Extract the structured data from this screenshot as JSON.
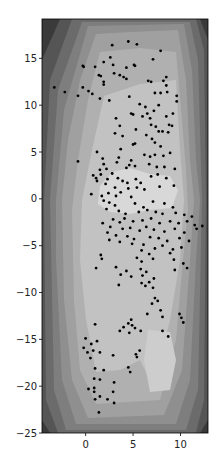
{
  "chart_data": {
    "type": "scatter",
    "subtype": "filled-contour-with-scatter",
    "title": "",
    "xlabel": "",
    "ylabel": "",
    "xlim": [
      -4.6,
      12.9
    ],
    "ylim": [
      -25,
      19.2
    ],
    "xticks": [
      0,
      5,
      10
    ],
    "yticks": [
      15,
      10,
      5,
      0,
      -5,
      -10,
      -15,
      -20,
      -25
    ],
    "grid": false,
    "legend": null,
    "colormap": "grayscale (dark outside, light center)",
    "contour_levels": [
      "#3a3a3a",
      "#555555",
      "#6b6b6b",
      "#7e7e7e",
      "#8f8f8f",
      "#a0a0a0",
      "#b0b0b0",
      "#c2c2c2",
      "#d8d8d8"
    ],
    "point_color": "#000000",
    "points": [
      [
        2.8,
        16.4
      ],
      [
        4.5,
        16.8
      ],
      [
        5.4,
        16.5
      ],
      [
        7.9,
        15.8
      ],
      [
        7.1,
        14.9
      ],
      [
        -0.3,
        14.2
      ],
      [
        -0.2,
        14.1
      ],
      [
        1,
        14.1
      ],
      [
        1.9,
        14.6
      ],
      [
        2.6,
        15.1
      ],
      [
        2.9,
        14.3
      ],
      [
        3,
        13.4
      ],
      [
        3.6,
        13.2
      ],
      [
        4.3,
        14
      ],
      [
        5.1,
        14.3
      ],
      [
        5.2,
        14.2
      ],
      [
        1.4,
        13.2
      ],
      [
        1.6,
        13.1
      ],
      [
        1.9,
        12.5
      ],
      [
        1.9,
        12.2
      ],
      [
        4,
        13
      ],
      [
        4.3,
        12.8
      ],
      [
        6.6,
        12.6
      ],
      [
        6.9,
        12.5
      ],
      [
        8.2,
        12.6
      ],
      [
        8.5,
        13
      ],
      [
        8.5,
        12.1
      ],
      [
        -3.3,
        11.9
      ],
      [
        -2.2,
        11.4
      ],
      [
        -0.8,
        11
      ],
      [
        -0.3,
        11.9
      ],
      [
        0.3,
        11.5
      ],
      [
        0.7,
        11.2
      ],
      [
        1.5,
        10.7
      ],
      [
        2.5,
        10.5
      ],
      [
        4.6,
        10.9
      ],
      [
        7.3,
        11.3
      ],
      [
        7.9,
        11.3
      ],
      [
        8.6,
        11.4
      ],
      [
        9.6,
        11
      ],
      [
        9.6,
        10.4
      ],
      [
        5.7,
        10.1
      ],
      [
        6.3,
        9.8
      ],
      [
        7.7,
        10
      ],
      [
        4.8,
        9.1
      ],
      [
        5,
        9
      ],
      [
        6,
        8.8
      ],
      [
        6.5,
        9.1
      ],
      [
        6.8,
        8.6
      ],
      [
        7.2,
        9.4
      ],
      [
        8.5,
        8.8
      ],
      [
        9.2,
        9.1
      ],
      [
        3.2,
        8.6
      ],
      [
        3.6,
        7.8
      ],
      [
        5.3,
        7.4
      ],
      [
        6.9,
        7.9
      ],
      [
        7.4,
        7.7
      ],
      [
        8.8,
        7.9
      ],
      [
        9.1,
        7.8
      ],
      [
        3.1,
        7
      ],
      [
        3.9,
        6.7
      ],
      [
        6.4,
        6.8
      ],
      [
        7.7,
        7.2
      ],
      [
        8.1,
        7.2
      ],
      [
        8.7,
        7.1
      ],
      [
        5,
        5.8
      ],
      [
        5.2,
        5.9
      ],
      [
        7,
        6.4
      ],
      [
        7.3,
        6
      ],
      [
        7.9,
        5.6
      ],
      [
        -0.8,
        4
      ],
      [
        1.2,
        5
      ],
      [
        3.7,
        5.3
      ],
      [
        1.8,
        4.3
      ],
      [
        3.5,
        4.4
      ],
      [
        4.8,
        4.1
      ],
      [
        6.2,
        4.7
      ],
      [
        6.8,
        4.5
      ],
      [
        7.3,
        4.7
      ],
      [
        8.2,
        4.6
      ],
      [
        8.9,
        4.9
      ],
      [
        1.5,
        3.1
      ],
      [
        1.9,
        3.7
      ],
      [
        2.2,
        3.2
      ],
      [
        3.3,
        3.9
      ],
      [
        4.3,
        3.3
      ],
      [
        4.6,
        3.6
      ],
      [
        5.2,
        3.5
      ],
      [
        6.7,
        3.7
      ],
      [
        7.5,
        3.4
      ],
      [
        8.3,
        3.4
      ],
      [
        9.4,
        3.2
      ],
      [
        0.8,
        2.5
      ],
      [
        1.1,
        2.2
      ],
      [
        1.6,
        2.6
      ],
      [
        2.3,
        2.1
      ],
      [
        2.8,
        2.7
      ],
      [
        3.4,
        2.2
      ],
      [
        3.9,
        1.9
      ],
      [
        4.4,
        1.7
      ],
      [
        5.3,
        2.1
      ],
      [
        5.8,
        1.7
      ],
      [
        6.9,
        2.4
      ],
      [
        7.6,
        2.6
      ],
      [
        8.5,
        2.2
      ],
      [
        1.2,
        1.9
      ],
      [
        2.1,
        1.6
      ],
      [
        3.1,
        1.2
      ],
      [
        4.5,
        1.1
      ],
      [
        5.4,
        1.2
      ],
      [
        6.2,
        1
      ],
      [
        7.8,
        1.3
      ],
      [
        9.3,
        1.4
      ],
      [
        0.6,
        0.5
      ],
      [
        1.7,
        0.3
      ],
      [
        2.4,
        0.6
      ],
      [
        3.2,
        0.3
      ],
      [
        3.7,
        0.7
      ],
      [
        4.8,
        0.2
      ],
      [
        1.9,
        -0.2
      ],
      [
        2.5,
        -0.4
      ],
      [
        3.1,
        -0.7
      ],
      [
        5.2,
        -0.5
      ],
      [
        6.1,
        -0.9
      ],
      [
        7.1,
        -0.3
      ],
      [
        8.3,
        -0.5
      ],
      [
        9.2,
        -0.9
      ],
      [
        2.2,
        -1.1
      ],
      [
        3.5,
        -1.3
      ],
      [
        4.2,
        -1.6
      ],
      [
        5.6,
        -1.4
      ],
      [
        6.5,
        -1.2
      ],
      [
        7.4,
        -1.4
      ],
      [
        8.1,
        -1.6
      ],
      [
        9.5,
        -1.5
      ],
      [
        10.4,
        -1.7
      ],
      [
        11.2,
        -1.9
      ],
      [
        2.9,
        -2.2
      ],
      [
        3.6,
        -2.5
      ],
      [
        4.1,
        -2.1
      ],
      [
        5,
        -2.4
      ],
      [
        6,
        -2.3
      ],
      [
        6.9,
        -2.1
      ],
      [
        7.8,
        -2.6
      ],
      [
        8.9,
        -2.4
      ],
      [
        9.8,
        -2.6
      ],
      [
        10.7,
        -2.4
      ],
      [
        11.5,
        -2.8
      ],
      [
        12.3,
        -2.9
      ],
      [
        1.8,
        -2.6
      ],
      [
        2.6,
        -3
      ],
      [
        3.9,
        -3.2
      ],
      [
        4.7,
        -3.1
      ],
      [
        5.7,
        -3.4
      ],
      [
        6.4,
        -3
      ],
      [
        7.2,
        -3.3
      ],
      [
        8.3,
        -3.5
      ],
      [
        9.4,
        -3.2
      ],
      [
        10.4,
        -3.6
      ],
      [
        11.7,
        -3.2
      ],
      [
        2.3,
        -3.6
      ],
      [
        3.2,
        -3.9
      ],
      [
        4.4,
        -4
      ],
      [
        5.1,
        -4.3
      ],
      [
        6.8,
        -4.1
      ],
      [
        7.7,
        -4.2
      ],
      [
        8.6,
        -4.5
      ],
      [
        9.9,
        -4.2
      ],
      [
        10.9,
        -4.5
      ],
      [
        2.5,
        -4.4
      ],
      [
        3.6,
        -4.6
      ],
      [
        4.9,
        -4.8
      ],
      [
        6.1,
        -4.9
      ],
      [
        7.3,
        -5.3
      ],
      [
        8.1,
        -5
      ],
      [
        9.2,
        -5.4
      ],
      [
        10.1,
        -5.2
      ],
      [
        5.9,
        -5.5
      ],
      [
        6.7,
        -5.9
      ],
      [
        8.9,
        -5.8
      ],
      [
        1.6,
        -6
      ],
      [
        1.7,
        -6.4
      ],
      [
        5.4,
        -6.3
      ],
      [
        5.9,
        -6.7
      ],
      [
        7.1,
        -6.4
      ],
      [
        9.3,
        -6.5
      ],
      [
        10.3,
        -6.9
      ],
      [
        3.2,
        -7.3
      ],
      [
        1.1,
        -7.4
      ],
      [
        4.3,
        -7.7
      ],
      [
        5.8,
        -7.5
      ],
      [
        6.4,
        -7.8
      ],
      [
        9.4,
        -7.6
      ],
      [
        10.7,
        -7.4
      ],
      [
        3.7,
        -8.1
      ],
      [
        4.8,
        -8.3
      ],
      [
        6,
        -8.2
      ],
      [
        6.7,
        -8.9
      ],
      [
        7.2,
        -8.5
      ],
      [
        3.5,
        -9.2
      ],
      [
        5.9,
        -9
      ],
      [
        6.3,
        -9.3
      ],
      [
        7.1,
        -9.5
      ],
      [
        7.3,
        -10.6
      ],
      [
        7.6,
        -10.9
      ],
      [
        7,
        -11.2
      ],
      [
        7.9,
        -11.9
      ],
      [
        6.5,
        -12.3
      ],
      [
        8.1,
        -12.6
      ],
      [
        9.9,
        -12.3
      ],
      [
        10.1,
        -12.7
      ],
      [
        10.3,
        -13.2
      ],
      [
        8.1,
        -14.1
      ],
      [
        8.7,
        -14.7
      ],
      [
        4.8,
        -12.9
      ],
      [
        4.5,
        -13.3
      ],
      [
        4.9,
        -13.5
      ],
      [
        4,
        -13.7
      ],
      [
        5.2,
        -13.8
      ],
      [
        3.6,
        -14.1
      ],
      [
        4.6,
        -14.3
      ],
      [
        5.8,
        -14.1
      ],
      [
        1,
        -13.4
      ],
      [
        0,
        -14.9
      ],
      [
        1.2,
        -15.2
      ],
      [
        0.6,
        -15.5
      ],
      [
        0.8,
        -16.2
      ],
      [
        1.5,
        -16.4
      ],
      [
        -0.2,
        -15.9
      ],
      [
        0.2,
        -16.4
      ],
      [
        0.5,
        -17
      ],
      [
        2.9,
        -16.7
      ],
      [
        5.3,
        -16.6
      ],
      [
        5.7,
        -16.2
      ],
      [
        5.4,
        -16.9
      ],
      [
        1,
        -18.1
      ],
      [
        1.9,
        -18.3
      ],
      [
        4.5,
        -18
      ],
      [
        4.7,
        -18.5
      ],
      [
        0.9,
        -19.2
      ],
      [
        1.5,
        -19.3
      ],
      [
        3,
        -19.6
      ],
      [
        0.3,
        -20.3
      ],
      [
        0.9,
        -20.2
      ],
      [
        0.9,
        -20.6
      ],
      [
        2.9,
        -20.6
      ],
      [
        1,
        -21.4
      ],
      [
        1.5,
        -21.1
      ],
      [
        2.3,
        -21.4
      ],
      [
        3,
        -21.8
      ],
      [
        1.4,
        -22.8
      ]
    ]
  }
}
